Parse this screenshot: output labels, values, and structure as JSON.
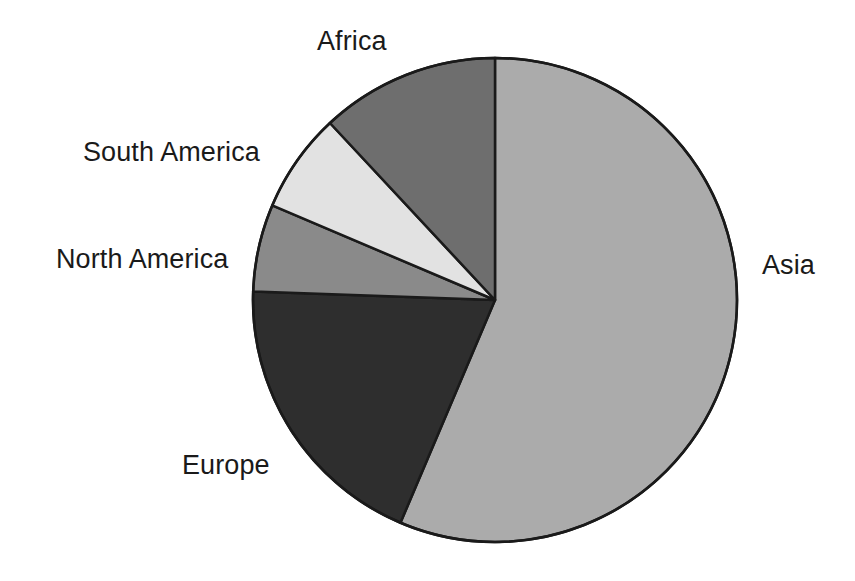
{
  "chart_data": {
    "type": "pie",
    "title": "",
    "subtitle": "",
    "xlabel": "",
    "ylabel": "",
    "legend_position": "none",
    "grid": false,
    "labels_placement": "outside-adjacent",
    "start_angle_deg": 0,
    "direction": "clockwise",
    "categories": [
      "Asia",
      "Europe",
      "North America",
      "South America",
      "Africa"
    ],
    "values": [
      56.4,
      19.2,
      5.8,
      6.7,
      11.9
    ],
    "units": "percent",
    "slices": [
      {
        "label": "Asia",
        "value": 56.4,
        "start_angle_deg": 0,
        "end_angle_deg": 203,
        "color": "#ababab"
      },
      {
        "label": "Europe",
        "value": 19.2,
        "start_angle_deg": 203,
        "end_angle_deg": 272,
        "color": "#2e2e2e"
      },
      {
        "label": "North America",
        "value": 5.8,
        "start_angle_deg": 272,
        "end_angle_deg": 293,
        "color": "#8a8a8a"
      },
      {
        "label": "South America",
        "value": 6.7,
        "start_angle_deg": 293,
        "end_angle_deg": 317,
        "color": "#e2e2e2"
      },
      {
        "label": "Africa",
        "value": 11.9,
        "start_angle_deg": 317,
        "end_angle_deg": 360,
        "color": "#6e6e6e"
      }
    ],
    "geometry": {
      "center_x": 495,
      "center_y": 300,
      "radius": 242,
      "outline_color": "#1a1a1a",
      "outline_width": 2.5
    },
    "background_color": "#ffffff"
  },
  "labels": {
    "africa": "Africa",
    "south_america": "South America",
    "north_america": "North America",
    "europe": "Europe",
    "asia": "Asia"
  }
}
